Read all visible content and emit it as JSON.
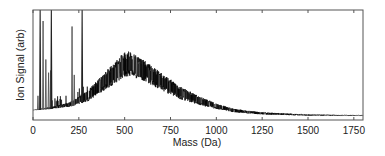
{
  "chart_data": {
    "type": "line",
    "title": "",
    "xlabel": "Mass (Da)",
    "ylabel": "Ion Signal (arb)",
    "xlim": [
      0,
      1800
    ],
    "ylim": [
      0,
      1
    ],
    "grid": false,
    "legend": null,
    "x_ticks": [
      0,
      250,
      500,
      750,
      1000,
      1250,
      1500,
      1750
    ],
    "x_tick_labels": [
      "0",
      "250",
      "500",
      "750",
      "1000",
      "1250",
      "1500",
      "1750"
    ],
    "y_ticks": [],
    "series": [
      {
        "name": "mass spectrum",
        "color": "#000000",
        "description": "Broad noisy distribution peaking near 510 Da with sharp low-mass peaks",
        "envelope": {
          "x": [
            0,
            100,
            200,
            300,
            400,
            500,
            525,
            600,
            700,
            800,
            900,
            1000,
            1100,
            1250,
            1500,
            1750,
            1800
          ],
          "upper": [
            0.09,
            0.12,
            0.16,
            0.27,
            0.45,
            0.62,
            0.63,
            0.55,
            0.43,
            0.31,
            0.22,
            0.15,
            0.1,
            0.07,
            0.05,
            0.045,
            0.045
          ],
          "lower": [
            0.09,
            0.1,
            0.12,
            0.17,
            0.28,
            0.39,
            0.4,
            0.36,
            0.27,
            0.19,
            0.14,
            0.1,
            0.07,
            0.05,
            0.04,
            0.04,
            0.04
          ]
        },
        "sharp_peaks": [
          {
            "x": 27,
            "y": 0.22
          },
          {
            "x": 39,
            "y": 1.0
          },
          {
            "x": 55,
            "y": 0.9
          },
          {
            "x": 70,
            "y": 0.55
          },
          {
            "x": 85,
            "y": 0.43
          },
          {
            "x": 96,
            "y": 0.45
          },
          {
            "x": 100,
            "y": 1.0
          },
          {
            "x": 213,
            "y": 0.85
          },
          {
            "x": 225,
            "y": 0.41
          },
          {
            "x": 268,
            "y": 1.0
          }
        ]
      }
    ]
  },
  "plot": {
    "box": {
      "left": 33,
      "top": 10,
      "right": 363,
      "bottom": 120
    },
    "line_color": "#000000",
    "axis_color": "#555555"
  }
}
